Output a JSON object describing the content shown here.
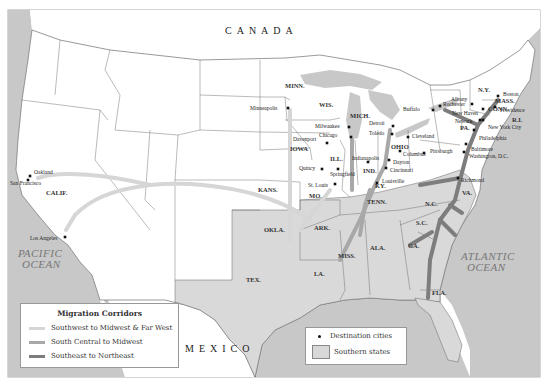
{
  "map": {
    "countries": {
      "north": "CANADA",
      "south": "MEXICO"
    },
    "oceans": {
      "pacific": [
        "PACIFIC",
        "OCEAN"
      ],
      "atlantic": [
        "ATLANTIC",
        "OCEAN"
      ]
    },
    "colors": {
      "land_other": "#ffffff",
      "land_southern": "#d9d9d9",
      "water": "#c8c8c8",
      "southwest_corridor": "#d6d6d6",
      "south_central_corridor": "#a8a8a8",
      "southeast_corridor": "#7d7d7d",
      "border": "#555555"
    },
    "state_labels": [
      {
        "id": "minn",
        "text": "MINN.",
        "x": 285,
        "y": 88
      },
      {
        "id": "wis",
        "text": "WIS.",
        "x": 319,
        "y": 107
      },
      {
        "id": "mich",
        "text": "MICH.",
        "x": 350,
        "y": 118
      },
      {
        "id": "iowa",
        "text": "IOWA",
        "x": 290,
        "y": 151
      },
      {
        "id": "ill",
        "text": "ILL.",
        "x": 330,
        "y": 161
      },
      {
        "id": "ind",
        "text": "IND.",
        "x": 363,
        "y": 173
      },
      {
        "id": "ohio",
        "text": "OHIO",
        "x": 391,
        "y": 149
      },
      {
        "id": "ny",
        "text": "N.Y.",
        "x": 478,
        "y": 92
      },
      {
        "id": "mass",
        "text": "MASS.",
        "x": 495,
        "y": 103
      },
      {
        "id": "conn",
        "text": "CONN.",
        "x": 488,
        "y": 111
      },
      {
        "id": "ri",
        "text": "R.I.",
        "x": 512,
        "y": 122
      },
      {
        "id": "pa",
        "text": "PA.",
        "x": 460,
        "y": 130
      },
      {
        "id": "va",
        "text": "VA.",
        "x": 462,
        "y": 195
      },
      {
        "id": "nc",
        "text": "N.C.",
        "x": 425,
        "y": 206
      },
      {
        "id": "sc",
        "text": "S.C.",
        "x": 416,
        "y": 225
      },
      {
        "id": "ga",
        "text": "GA.",
        "x": 408,
        "y": 248
      },
      {
        "id": "fla",
        "text": "FLA.",
        "x": 432,
        "y": 295
      },
      {
        "id": "ala",
        "text": "ALA.",
        "x": 370,
        "y": 250
      },
      {
        "id": "miss",
        "text": "MISS.",
        "x": 338,
        "y": 258
      },
      {
        "id": "la",
        "text": "LA.",
        "x": 314,
        "y": 276
      },
      {
        "id": "ark",
        "text": "ARK.",
        "x": 314,
        "y": 230
      },
      {
        "id": "tenn",
        "text": "TENN.",
        "x": 367,
        "y": 204
      },
      {
        "id": "ky",
        "text": "KY.",
        "x": 375,
        "y": 188
      },
      {
        "id": "mo",
        "text": "MO.",
        "x": 309,
        "y": 198
      },
      {
        "id": "kans",
        "text": "KANS.",
        "x": 258,
        "y": 192
      },
      {
        "id": "okla",
        "text": "OKLA.",
        "x": 264,
        "y": 232
      },
      {
        "id": "tex",
        "text": "TEX.",
        "x": 246,
        "y": 282
      },
      {
        "id": "calif",
        "text": "CALIF.",
        "x": 46,
        "y": 195
      }
    ],
    "cities": [
      {
        "name": "Minneapolis",
        "x": 288,
        "y": 108,
        "lx": 250,
        "ly": 110
      },
      {
        "name": "Milwaukee",
        "x": 349,
        "y": 127,
        "lx": 315,
        "ly": 128
      },
      {
        "name": "Chicago",
        "x": 351,
        "y": 137,
        "lx": 319,
        "ly": 137
      },
      {
        "name": "Davenport",
        "x": 327,
        "y": 143,
        "lx": 293,
        "ly": 141
      },
      {
        "name": "Detroit",
        "x": 393,
        "y": 126,
        "lx": 369,
        "ly": 125
      },
      {
        "name": "Toledo",
        "x": 392,
        "y": 134,
        "lx": 369,
        "ly": 135
      },
      {
        "name": "Cleveland",
        "x": 408,
        "y": 137,
        "lx": 412,
        "ly": 138
      },
      {
        "name": "Buffalo",
        "x": 433,
        "y": 110,
        "lx": 403,
        "ly": 111
      },
      {
        "name": "Rochester",
        "x": 440,
        "y": 106,
        "lx": 443,
        "ly": 106
      },
      {
        "name": "Albany",
        "x": 472,
        "y": 104,
        "lx": 451,
        "ly": 101
      },
      {
        "name": "Boston",
        "x": 498,
        "y": 96,
        "lx": 503,
        "ly": 96
      },
      {
        "name": "Providence",
        "x": 495,
        "y": 107,
        "lx": 500,
        "ly": 112
      },
      {
        "name": "New Haven",
        "x": 483,
        "y": 109,
        "lx": 452,
        "ly": 115
      },
      {
        "name": "Newark",
        "x": 480,
        "y": 120,
        "lx": 455,
        "ly": 123
      },
      {
        "name": "New York City",
        "x": 483,
        "y": 120,
        "lx": 488,
        "ly": 129
      },
      {
        "name": "Philadelphia",
        "x": 474,
        "y": 130,
        "lx": 479,
        "ly": 140
      },
      {
        "name": "Baltimore",
        "x": 466,
        "y": 144,
        "lx": 471,
        "ly": 151
      },
      {
        "name": "Washington, D.C.",
        "x": 464,
        "y": 152,
        "lx": 469,
        "ly": 158
      },
      {
        "name": "Pittsburgh",
        "x": 424,
        "y": 153,
        "lx": 430,
        "ly": 153
      },
      {
        "name": "Columbus",
        "x": 400,
        "y": 151,
        "lx": 403,
        "ly": 156
      },
      {
        "name": "Indianapolis",
        "x": 368,
        "y": 162,
        "lx": 352,
        "ly": 160
      },
      {
        "name": "Dayton",
        "x": 389,
        "y": 160,
        "lx": 393,
        "ly": 164
      },
      {
        "name": "Cincinnati",
        "x": 386,
        "y": 168,
        "lx": 390,
        "ly": 172
      },
      {
        "name": "Louisville",
        "x": 377,
        "y": 183,
        "lx": 382,
        "ly": 183
      },
      {
        "name": "Richmond",
        "x": 458,
        "y": 178,
        "lx": 461,
        "ly": 182
      },
      {
        "name": "Quincy",
        "x": 322,
        "y": 169,
        "lx": 299,
        "ly": 170
      },
      {
        "name": "Springfield",
        "x": 338,
        "y": 169,
        "lx": 330,
        "ly": 176
      },
      {
        "name": "St. Louis",
        "x": 335,
        "y": 184,
        "lx": 308,
        "ly": 187
      },
      {
        "name": "Oakland",
        "x": 30,
        "y": 176,
        "lx": 34,
        "ly": 174
      },
      {
        "name": "San Francisco",
        "x": 28,
        "y": 180,
        "lx": 10,
        "ly": 185
      },
      {
        "name": "Los Angeles",
        "x": 65,
        "y": 237,
        "lx": 30,
        "ly": 240
      }
    ]
  },
  "legend_corridors": {
    "title": "Migration Corridors",
    "items": [
      {
        "label": "Southwest to Midwest & Far West",
        "color": "#d6d6d6"
      },
      {
        "label": "South Central to Midwest",
        "color": "#a8a8a8"
      },
      {
        "label": "Southeast to Northeast",
        "color": "#7d7d7d"
      }
    ]
  },
  "legend_symbols": {
    "items": [
      {
        "label": "Destination cities",
        "symbol": "dot"
      },
      {
        "label": "Southern states",
        "symbol": "gray-box"
      }
    ]
  }
}
